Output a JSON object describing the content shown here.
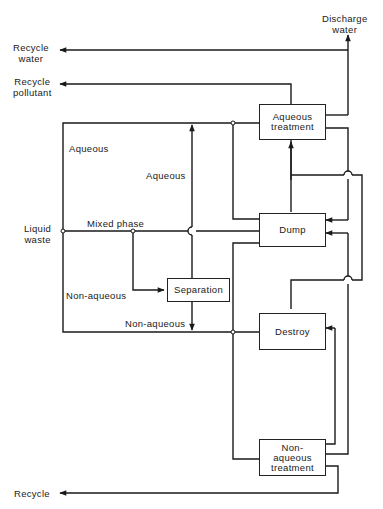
{
  "inputs": {
    "liquid_waste": "Liquid\nwaste"
  },
  "outputs": {
    "recycle_water": "Recycle\nwater",
    "recycle_pollutant": "Recycle\npollutant",
    "discharge_water": "Discharge\nwater",
    "recycle": "Recycle"
  },
  "nodes": {
    "aqueous_treatment": "Aqueous\ntreatment",
    "dump": "Dump",
    "separation": "Separation",
    "destroy": "Destroy",
    "non_aqueous_treatment": "Non-\naqueous\ntreatment"
  },
  "flow_labels": {
    "aqueous_top": "Aqueous",
    "aqueous_separation": "Aqueous",
    "mixed_phase": "Mixed phase",
    "non_aqueous_left": "Non-aqueous",
    "non_aqueous_separation": "Non-aqueous"
  },
  "colors": {
    "line": "#1a1a1a",
    "background": "#ffffff"
  }
}
